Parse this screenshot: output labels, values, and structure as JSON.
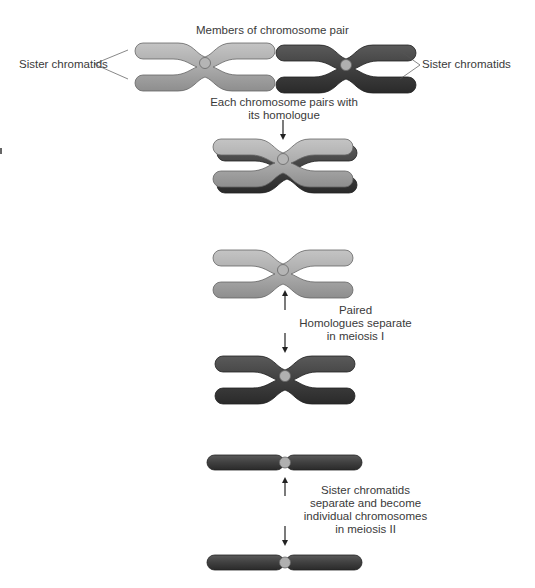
{
  "labels": {
    "members_pair": "Members of chromosome pair",
    "sister_left": "Sister chromatids",
    "sister_right": "Sister chromatids",
    "pairs_line1": "Each chromosome pairs with",
    "pairs_line2": "its homologue",
    "meiosis1_line1": "Paired",
    "meiosis1_line2": "Homologues separate",
    "meiosis1_line3": "in meiosis I",
    "meiosis2_line1": "Sister chromatids",
    "meiosis2_line2": "separate and become",
    "meiosis2_line3": "individual chromosomes",
    "meiosis2_line4": "in meiosis II"
  },
  "colors": {
    "light_chromosome": "#a9a9a9",
    "dark_chromosome": "#3f3f3f",
    "centromere": "#b0b0b0",
    "outline": "#555555",
    "arrow": "#222222"
  }
}
